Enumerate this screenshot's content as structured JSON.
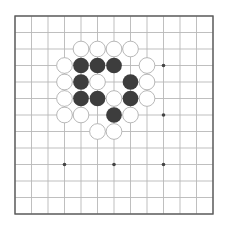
{
  "board": {
    "size": 13,
    "origin_x": 15,
    "origin_y": 16,
    "spacing": 16.5,
    "background": "#ffffff",
    "line_color": "#b8b8b8",
    "border_color": "#5a5a5a",
    "star_color": "#444444",
    "star_points": [
      [
        9,
        3
      ],
      [
        9,
        6
      ],
      [
        3,
        9
      ],
      [
        6,
        9
      ],
      [
        9,
        9
      ]
    ]
  },
  "stones": {
    "black_color": "#3d3d3d",
    "white_fill": "#ffffff",
    "white_stroke": "#b0b0b0",
    "black": [
      [
        4,
        3
      ],
      [
        5,
        3
      ],
      [
        6,
        3
      ],
      [
        4,
        4
      ],
      [
        7,
        4
      ],
      [
        4,
        5
      ],
      [
        5,
        5
      ],
      [
        7,
        5
      ],
      [
        6,
        6
      ]
    ],
    "white": [
      [
        4,
        2
      ],
      [
        5,
        2
      ],
      [
        6,
        2
      ],
      [
        7,
        2
      ],
      [
        3,
        3
      ],
      [
        8,
        3
      ],
      [
        3,
        4
      ],
      [
        5,
        4
      ],
      [
        8,
        4
      ],
      [
        3,
        5
      ],
      [
        6,
        5
      ],
      [
        8,
        5
      ],
      [
        3,
        6
      ],
      [
        4,
        6
      ],
      [
        7,
        6
      ],
      [
        5,
        7
      ],
      [
        6,
        7
      ]
    ]
  }
}
